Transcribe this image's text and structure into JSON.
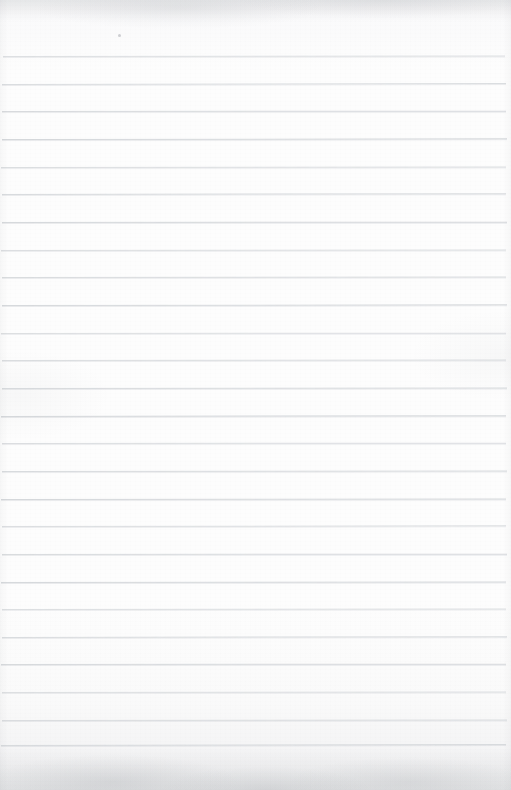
{
  "document": {
    "kind": "scanned-blank-ruled-notebook-page",
    "page_text": "",
    "handwriting_text": "",
    "printed_text": "",
    "width_px": 511,
    "height_px": 790
  },
  "paper": {
    "background_color": "#fcfcfc",
    "top_edge_tint": "#f2f3f4",
    "bottom_edge_tint": "#eeeff0",
    "texture": "fine paper grain with bottom-edge scanner shading"
  },
  "ruling": {
    "style": "horizontal ruled lines",
    "line_color": "#d5d8db",
    "line_thickness_px": 1,
    "line_count": 26,
    "first_line_y": 56,
    "spacing_px": 27.6,
    "last_line_y": 745,
    "left_x": 2,
    "right_x": 506,
    "margin_rule": "none",
    "tilt_note": "lines are very slightly non-parallel from the scan",
    "lines": [
      {
        "y": 56,
        "x1": 3,
        "x2": 505,
        "tilt_deg": -0.06
      },
      {
        "y": 84,
        "x1": 2,
        "x2": 506,
        "tilt_deg": -0.1
      },
      {
        "y": 111,
        "x1": 2,
        "x2": 506,
        "tilt_deg": -0.04
      },
      {
        "y": 139,
        "x1": 2,
        "x2": 507,
        "tilt_deg": -0.08
      },
      {
        "y": 167,
        "x1": 1,
        "x2": 506,
        "tilt_deg": -0.05
      },
      {
        "y": 194,
        "x1": 2,
        "x2": 506,
        "tilt_deg": -0.09
      },
      {
        "y": 222,
        "x1": 2,
        "x2": 507,
        "tilt_deg": -0.04
      },
      {
        "y": 250,
        "x1": 1,
        "x2": 506,
        "tilt_deg": -0.07
      },
      {
        "y": 277,
        "x1": 2,
        "x2": 506,
        "tilt_deg": -0.05
      },
      {
        "y": 305,
        "x1": 2,
        "x2": 507,
        "tilt_deg": -0.08
      },
      {
        "y": 333,
        "x1": 1,
        "x2": 506,
        "tilt_deg": -0.04
      },
      {
        "y": 360,
        "x1": 2,
        "x2": 506,
        "tilt_deg": -0.07
      },
      {
        "y": 388,
        "x1": 2,
        "x2": 507,
        "tilt_deg": -0.05
      },
      {
        "y": 416,
        "x1": 1,
        "x2": 506,
        "tilt_deg": -0.09
      },
      {
        "y": 443,
        "x1": 2,
        "x2": 506,
        "tilt_deg": -0.04
      },
      {
        "y": 471,
        "x1": 2,
        "x2": 507,
        "tilt_deg": -0.07
      },
      {
        "y": 499,
        "x1": 1,
        "x2": 506,
        "tilt_deg": -0.05
      },
      {
        "y": 526,
        "x1": 2,
        "x2": 506,
        "tilt_deg": -0.08
      },
      {
        "y": 554,
        "x1": 2,
        "x2": 507,
        "tilt_deg": -0.04
      },
      {
        "y": 582,
        "x1": 1,
        "x2": 506,
        "tilt_deg": -0.07
      },
      {
        "y": 609,
        "x1": 2,
        "x2": 506,
        "tilt_deg": -0.05
      },
      {
        "y": 637,
        "x1": 2,
        "x2": 507,
        "tilt_deg": -0.09
      },
      {
        "y": 664,
        "x1": 1,
        "x2": 506,
        "tilt_deg": -0.04
      },
      {
        "y": 692,
        "x1": 2,
        "x2": 506,
        "tilt_deg": -0.07
      },
      {
        "y": 720,
        "x1": 2,
        "x2": 507,
        "tilt_deg": -0.05
      },
      {
        "y": 745,
        "x1": 1,
        "x2": 506,
        "tilt_deg": -0.1
      }
    ]
  },
  "artifacts": {
    "speck": {
      "x": 118,
      "y": 34,
      "size_px": 3,
      "color": "#969aa0"
    }
  }
}
